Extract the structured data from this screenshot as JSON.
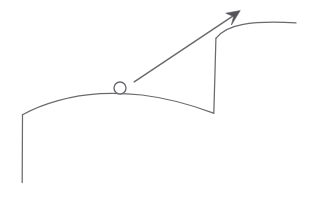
{
  "figure": {
    "background_color": "#ffffff",
    "ink_color": "#6a6a70",
    "arrowhead_color": "#55555c",
    "canvas": {
      "width": 311,
      "height": 197
    }
  },
  "elements": {
    "left_vertical_line": {
      "name": "left-vertical-line",
      "x1": 22,
      "y1": 115,
      "x2": 22,
      "y2": 182
    },
    "lower_hill_curve": {
      "name": "lower-hill-curve",
      "start": [
        22,
        115
      ],
      "apex": [
        120,
        93
      ],
      "end": [
        213,
        113
      ]
    },
    "riser_vertical_line": {
      "name": "riser-vertical-line",
      "x1": 214,
      "y1": 113,
      "x2": 216,
      "y2": 38
    },
    "upper_plateau_curve": {
      "name": "upper-plateau-curve",
      "start": [
        216,
        38
      ],
      "end": [
        296,
        23
      ]
    },
    "ball": {
      "name": "ball-circle",
      "center": [
        120,
        88
      ],
      "radius": 6
    },
    "trajectory_arrow": {
      "name": "trajectory-arrow",
      "start": [
        134,
        82
      ],
      "tip": [
        240,
        11
      ]
    }
  },
  "labels": {
    "none_visible": ""
  }
}
